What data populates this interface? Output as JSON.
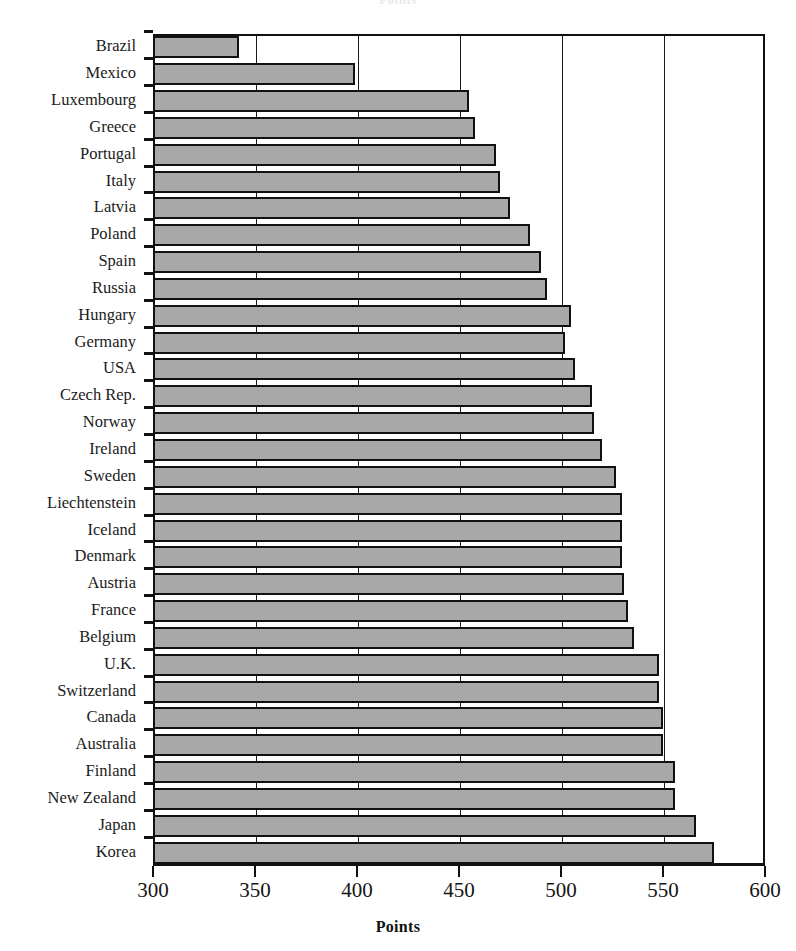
{
  "chart_data": {
    "type": "bar",
    "orientation": "horizontal",
    "title": "Points",
    "subtitle": "",
    "xlabel": "Points",
    "ylabel": "",
    "xlim": [
      300,
      600
    ],
    "xticks": [
      300,
      350,
      400,
      450,
      500,
      550,
      600
    ],
    "xtick_labels": [
      "300",
      "350",
      "400",
      "450",
      "500",
      "550",
      "600"
    ],
    "grid": true,
    "grid_axis": "x",
    "legend": false,
    "legend_position": "none",
    "bar_fill_color": "#a8a8a8",
    "bar_edge_color": "#111111",
    "categories": [
      "Brazil",
      "Mexico",
      "Luxembourg",
      "Greece",
      "Portugal",
      "Italy",
      "Latvia",
      "Poland",
      "Spain",
      "Russia",
      "Hungary",
      "Germany",
      "USA",
      "Czech Rep.",
      "Norway",
      "Ireland",
      "Sweden",
      "Liechtenstein",
      "Iceland",
      "Denmark",
      "Austria",
      "France",
      "Belgium",
      "U.K.",
      "Switzerland",
      "Canada",
      "Australia",
      "Finland",
      "New Zealand",
      "Japan",
      "Korea"
    ],
    "values": [
      342,
      399,
      455,
      458,
      468,
      470,
      475,
      485,
      490,
      493,
      505,
      502,
      507,
      515,
      516,
      520,
      527,
      530,
      530,
      530,
      531,
      533,
      536,
      548,
      548,
      550,
      550,
      556,
      556,
      566,
      575
    ]
  }
}
